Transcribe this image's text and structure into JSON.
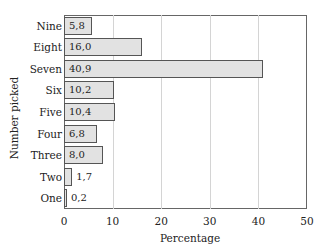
{
  "chart_data": {
    "type": "bar",
    "orientation": "horizontal",
    "title": "",
    "xlabel": "Percentage",
    "ylabel": "Number picked",
    "xlim": [
      0,
      50
    ],
    "xticks": [
      "0",
      "10",
      "20",
      "30",
      "40",
      "50"
    ],
    "grid": "vertical",
    "categories": [
      "Nine",
      "Eight",
      "Seven",
      "Six",
      "Five",
      "Four",
      "Three",
      "Two",
      "One"
    ],
    "values": [
      5.8,
      16.0,
      40.9,
      10.2,
      10.4,
      6.8,
      8.0,
      1.7,
      0.2
    ],
    "value_labels": [
      "5,8",
      "16,0",
      "40,9",
      "10,2",
      "10,4",
      "6,8",
      "8,0",
      "1,7",
      "0,2"
    ],
    "bar_color": "#e2e2e2",
    "bar_edge_color": "#555555"
  }
}
